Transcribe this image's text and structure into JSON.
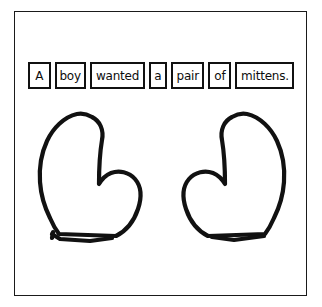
{
  "page": {
    "title": "A boy wanted a pair of mittens.",
    "background_color": "#ffffff",
    "frame_color": "#1a1a1a",
    "ink_color": "#111111"
  },
  "sentence": {
    "full_text": "A boy wanted a pair of mittens.",
    "word_boxes": [
      {
        "text": "A",
        "width_px": 24
      },
      {
        "text": "boy",
        "width_px": 31
      },
      {
        "text": "wanted",
        "width_px": 56
      },
      {
        "text": "a",
        "width_px": 19
      },
      {
        "text": "pair",
        "width_px": 33
      },
      {
        "text": "of",
        "width_px": 24
      },
      {
        "text": "mittens.",
        "width_px": 59
      }
    ]
  },
  "drawing": {
    "description": "two hand-drawn mitten outlines",
    "items": [
      {
        "label": "left-mitten",
        "thumb_side": "right"
      },
      {
        "label": "right-mitten",
        "thumb_side": "left"
      }
    ]
  }
}
